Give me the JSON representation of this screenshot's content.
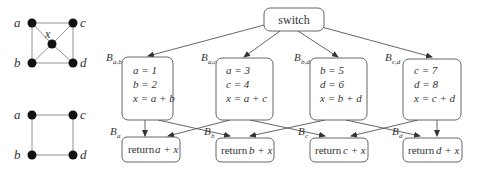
{
  "graphs": {
    "top": {
      "nodes": [
        {
          "id": "a",
          "label": "a",
          "x": 22,
          "y": 23,
          "lx": 9,
          "ly": 27
        },
        {
          "id": "c",
          "label": "c",
          "x": 73,
          "y": 23,
          "lx": 82,
          "ly": 27
        },
        {
          "id": "x",
          "label": "x",
          "x": 52,
          "y": 44,
          "lx": 37,
          "ly": 41
        },
        {
          "id": "b",
          "label": "b",
          "x": 32,
          "y": 63,
          "lx": 9,
          "ly": 67
        },
        {
          "id": "d",
          "label": "d",
          "x": 73,
          "y": 63,
          "lx": 82,
          "ly": 67
        }
      ],
      "edges": [
        [
          "a",
          "c"
        ],
        [
          "a",
          "b"
        ],
        [
          "c",
          "d"
        ],
        [
          "b",
          "d"
        ],
        [
          "a",
          "x"
        ],
        [
          "c",
          "x"
        ],
        [
          "b",
          "x"
        ],
        [
          "d",
          "x"
        ]
      ]
    },
    "bottom": {
      "nodes": [
        {
          "id": "a",
          "label": "a",
          "x": 32,
          "y": 115,
          "lx": 9,
          "ly": 119
        },
        {
          "id": "c",
          "label": "c",
          "x": 73,
          "y": 115,
          "lx": 82,
          "ly": 119
        },
        {
          "id": "b",
          "label": "b",
          "x": 32,
          "y": 155,
          "lx": 9,
          "ly": 159
        },
        {
          "id": "d",
          "label": "d",
          "x": 73,
          "y": 155,
          "lx": 82,
          "ly": 159
        }
      ],
      "edges": [
        [
          "a",
          "c"
        ],
        [
          "a",
          "b"
        ],
        [
          "c",
          "d"
        ],
        [
          "b",
          "d"
        ]
      ]
    }
  },
  "flowchart": {
    "switch": {
      "label": "switch"
    },
    "blocks": [
      {
        "name": "B",
        "sub": "a,b",
        "lines": [
          "a = 1",
          "b = 2",
          "x = a + b"
        ]
      },
      {
        "name": "B",
        "sub": "a,c",
        "lines": [
          "a = 3",
          "c = 4",
          "x = a + c"
        ]
      },
      {
        "name": "B",
        "sub": "b,d",
        "lines": [
          "b = 5",
          "d = 6",
          "x = b + d"
        ]
      },
      {
        "name": "B",
        "sub": "c,d",
        "lines": [
          "c = 7",
          "d = 8",
          "x = c + d"
        ]
      }
    ],
    "returns": [
      {
        "name": "B",
        "sub": "a",
        "kw": "return",
        "expr": "a + x"
      },
      {
        "name": "B",
        "sub": "b",
        "kw": "return",
        "expr": "b + x"
      },
      {
        "name": "B",
        "sub": "c",
        "kw": "return",
        "expr": "c + x"
      },
      {
        "name": "B",
        "sub": "d",
        "kw": "return",
        "expr": "d + x"
      }
    ]
  }
}
